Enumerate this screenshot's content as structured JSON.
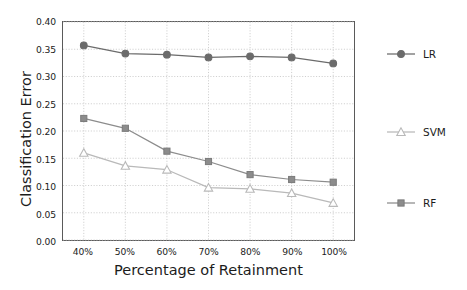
{
  "chart_data": {
    "type": "line",
    "title": "",
    "xlabel": "Percentage of Retainment",
    "ylabel": "Classification Error",
    "categories": [
      "40%",
      "50%",
      "60%",
      "70%",
      "80%",
      "90%",
      "100%"
    ],
    "x": [
      40,
      50,
      60,
      70,
      80,
      90,
      100
    ],
    "xlim": [
      35,
      105
    ],
    "ylim": [
      0.0,
      0.4
    ],
    "yticks": [
      "0.00",
      "0.05",
      "0.10",
      "0.15",
      "0.20",
      "0.25",
      "0.30",
      "0.35",
      "0.40"
    ],
    "ytick_values": [
      0.0,
      0.05,
      0.1,
      0.15,
      0.2,
      0.25,
      0.3,
      0.35,
      0.4
    ],
    "grid": true,
    "grid_style": "dotted",
    "legend_position": "right",
    "series": [
      {
        "name": "LR",
        "marker": "circle",
        "marker_filled": true,
        "color": "#6b6b6b",
        "values": [
          0.357,
          0.342,
          0.34,
          0.335,
          0.337,
          0.335,
          0.324
        ]
      },
      {
        "name": "SVM",
        "marker": "triangle",
        "marker_filled": false,
        "color": "#b9b9b9",
        "values": [
          0.16,
          0.136,
          0.129,
          0.096,
          0.094,
          0.086,
          0.068
        ]
      },
      {
        "name": "RF",
        "marker": "square",
        "marker_filled": true,
        "color": "#8c8c8c",
        "values": [
          0.223,
          0.205,
          0.163,
          0.144,
          0.12,
          0.111,
          0.106
        ]
      }
    ]
  },
  "legend": {
    "entries": [
      {
        "label": "LR"
      },
      {
        "label": "SVM"
      },
      {
        "label": "RF"
      }
    ]
  },
  "colors": {
    "axis": "#5a5a5a",
    "grid": "#c9c9c9",
    "text": "#1c1c1c",
    "background": "#ffffff"
  }
}
